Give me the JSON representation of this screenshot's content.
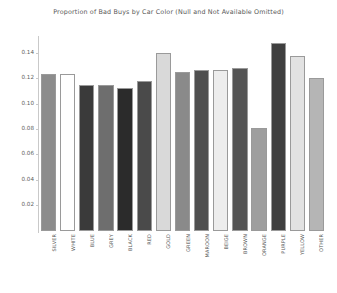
{
  "chart_data": {
    "type": "bar",
    "title": "Proportion of Bad Buys by Car Color (Null and Not Available Omitted)",
    "xlabel": "",
    "ylabel": "",
    "ylim": [
      0.0,
      0.152
    ],
    "yticks": [
      0.02,
      0.04,
      0.06,
      0.08,
      0.1,
      0.12,
      0.14
    ],
    "ytick_labels": [
      "0.02",
      "0.04",
      "0.06",
      "0.08",
      "0.10",
      "0.12",
      "0.14"
    ],
    "grid": false,
    "legend": "none",
    "categories": [
      "SILVER",
      "WHITE",
      "BLUE",
      "GREY",
      "BLACK",
      "RED",
      "GOLD",
      "GREEN",
      "MAROON",
      "BEIGE",
      "BROWN",
      "ORANGE",
      "PURPLE",
      "YELLOW",
      "OTHER"
    ],
    "values": [
      0.124,
      0.1238,
      0.1152,
      0.115,
      0.1128,
      0.1183,
      0.14,
      0.1253,
      0.1265,
      0.1268,
      0.1285,
      0.0812,
      0.148,
      0.1378,
      0.1202
    ],
    "bar_colors": [
      "#8c8c8c",
      "#ffffff",
      "#3a3a3a",
      "#6e6e6e",
      "#2b2b2b",
      "#4a4a4a",
      "#d9d9d9",
      "#8a8a8a",
      "#4f4f4f",
      "#ededed",
      "#555555",
      "#9e9e9e",
      "#3f3f3f",
      "#e2e2e2",
      "#b5b5b5"
    ]
  }
}
